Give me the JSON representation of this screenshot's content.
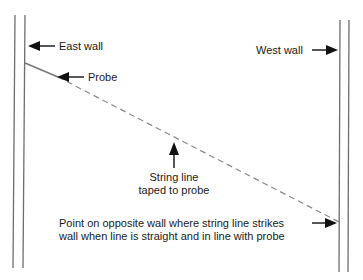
{
  "labels": {
    "east_wall": "East wall",
    "west_wall": "West wall",
    "probe": "Probe",
    "string_line_1": "String line",
    "string_line_2": "taped to probe",
    "point_line_1": "Point on opposite wall where string line strikes",
    "point_line_2": "wall when line is straight and in line with probe"
  },
  "colors": {
    "wall": "#6e6e6e",
    "probe": "#777777",
    "string": "#8a8a8a",
    "arrow": "#111111",
    "text": "#1a1a1a"
  }
}
